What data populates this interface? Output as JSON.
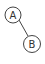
{
  "diagram": {
    "type": "tree",
    "nodes": [
      {
        "id": "A",
        "label": "A",
        "cx": 13,
        "cy": 15,
        "r": 8
      },
      {
        "id": "B",
        "label": "B",
        "cx": 32,
        "cy": 44,
        "r": 8.5
      }
    ],
    "edges": [
      {
        "from": "A",
        "to": "B"
      }
    ],
    "colors": {
      "stroke": "#444444",
      "fill": "#ffffff",
      "text": "#333333"
    }
  }
}
